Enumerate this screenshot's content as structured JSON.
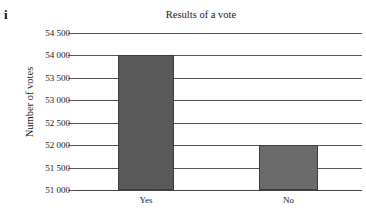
{
  "figure": {
    "index_label": "i"
  },
  "chart_data": {
    "type": "bar",
    "title": "Results of a vote",
    "xlabel": "",
    "ylabel": "Number of votes",
    "categories": [
      "Yes",
      "No"
    ],
    "values": [
      54000,
      52000
    ],
    "ylim": [
      51000,
      54500
    ],
    "ytick_values": [
      51000,
      51500,
      52000,
      52500,
      53000,
      53500,
      54000,
      54500
    ],
    "ytick_labels": [
      "51 000",
      "51 500",
      "52 000",
      "52 500",
      "53 000",
      "53 500",
      "54 000",
      "54 500"
    ],
    "grid": true,
    "legend": "none",
    "bar_color": "#595959",
    "gridline_color": "#555555",
    "background_color": "#ffffff"
  }
}
